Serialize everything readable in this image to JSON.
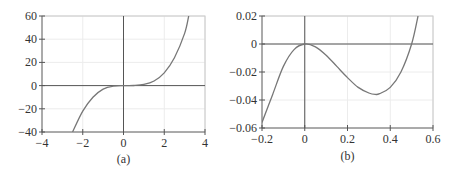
{
  "chart_data": [
    {
      "type": "line",
      "panel": "a",
      "caption": "(a)",
      "title": "",
      "xlabel": "",
      "ylabel": "",
      "xlim": [
        -4,
        4
      ],
      "ylim": [
        -40,
        60
      ],
      "xticks": [
        -4,
        -2,
        0,
        2,
        4
      ],
      "xtick_labels": [
        "−4",
        "−2",
        "0",
        "2",
        "4"
      ],
      "yticks": [
        -40,
        -20,
        0,
        20,
        40,
        60
      ],
      "ytick_labels": [
        "−40",
        "−20",
        "0",
        "20",
        "40",
        "60"
      ],
      "grid": true,
      "series": [
        {
          "name": "f(x)",
          "description": "cubic-like curve, flat near origin, ~ 2x^3 - 3x^2 shape near 0",
          "x": [
            -2.5,
            -2.0,
            -1.5,
            -1.0,
            -0.5,
            0,
            0.5,
            1.0,
            1.5,
            2.0,
            2.5,
            3.0,
            3.2
          ],
          "y": [
            -40,
            -22,
            -10,
            -3,
            -0.4,
            0,
            0.1,
            1,
            4,
            11,
            24,
            45,
            60
          ]
        }
      ]
    },
    {
      "type": "line",
      "panel": "b",
      "caption": "(b)",
      "title": "",
      "xlabel": "",
      "ylabel": "",
      "xlim": [
        -0.2,
        0.6
      ],
      "ylim": [
        -0.06,
        0.02
      ],
      "xticks": [
        -0.2,
        0,
        0.2,
        0.4,
        0.6
      ],
      "xtick_labels": [
        "−0.2",
        "0",
        "0.2",
        "0.4",
        "0.6"
      ],
      "yticks": [
        -0.06,
        -0.04,
        -0.02,
        0,
        0.02
      ],
      "ytick_labels": [
        "−0.06",
        "−0.04",
        "−0.02",
        "0",
        "0.02"
      ],
      "grid": true,
      "series": [
        {
          "name": "f(x) zoomed",
          "description": "local max at x=0 (y=0), local min near x≈0.33 (y≈−0.036), root near x≈0.5",
          "x": [
            -0.2,
            -0.15,
            -0.1,
            -0.05,
            0,
            0.05,
            0.1,
            0.15,
            0.2,
            0.25,
            0.3,
            0.33,
            0.35,
            0.4,
            0.45,
            0.5,
            0.53
          ],
          "y": [
            -0.056,
            -0.036,
            -0.016,
            -0.004,
            0,
            -0.002,
            -0.008,
            -0.016,
            -0.024,
            -0.031,
            -0.035,
            -0.036,
            -0.0355,
            -0.031,
            -0.02,
            0,
            0.02
          ]
        }
      ]
    }
  ]
}
